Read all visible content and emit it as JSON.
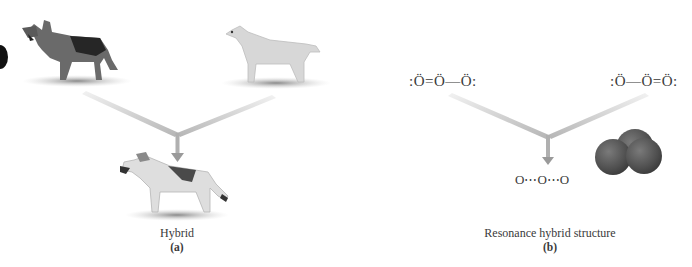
{
  "panel_a": {
    "parent_left": {
      "icon": "german-shepherd-dog"
    },
    "parent_right": {
      "icon": "labrador-retriever-dog"
    },
    "offspring": {
      "icon": "hybrid-dog"
    },
    "caption": "Hybrid",
    "label": "(a)"
  },
  "panel_b": {
    "structure_left": ":Ö=Ö—Ö:",
    "structure_right": ":Ö—Ö=Ö:",
    "hybrid_formula": "O⋯O⋯O",
    "hybrid_model": {
      "icon": "ozone-space-filling-model"
    },
    "caption": "Resonance hybrid structure",
    "label": "(b)"
  },
  "colors": {
    "arrow": "#bdbdbd",
    "arrow_dark": "#9a9a9a",
    "molecule": "#555555",
    "text": "#3a3a3a"
  }
}
